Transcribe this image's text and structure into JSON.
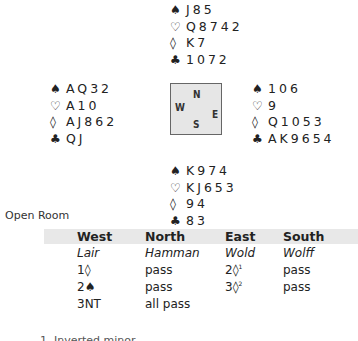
{
  "deal": {
    "north": {
      "spades": "J85",
      "hearts": "Q8742",
      "diamonds": "K7",
      "clubs": "1072"
    },
    "west": {
      "spades": "AQ32",
      "hearts": "A10",
      "diamonds": "AJ862",
      "clubs": "QJ"
    },
    "east": {
      "spades": "106",
      "hearts": "9",
      "diamonds": "Q1053",
      "clubs": "AK9654"
    },
    "south": {
      "spades": "K974",
      "hearts": "KJ653",
      "diamonds": "94",
      "clubs": "83"
    }
  },
  "suit_symbols": {
    "spades": "♠",
    "hearts": "♡",
    "diamonds": "◊",
    "clubs": "♣"
  },
  "compass": {
    "n": "N",
    "w": "W",
    "e": "E",
    "s": "S"
  },
  "room_label": "Open Room",
  "auction": {
    "headers": [
      "West",
      "North",
      "East",
      "South"
    ],
    "players": [
      "Lair",
      "Hamman",
      "Wold",
      "Wolff"
    ],
    "rounds": [
      [
        "1◊",
        "pass",
        "2◊",
        "pass"
      ],
      [
        "2♠",
        "pass",
        "3◊",
        "pass"
      ],
      [
        "3NT",
        "all pass",
        "",
        ""
      ]
    ],
    "footnote_marks": {
      "r0c2": "1",
      "r1c2": "2"
    }
  },
  "footnote_partial": "1. Inverted minor"
}
